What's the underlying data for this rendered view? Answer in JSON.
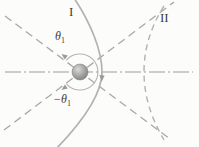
{
  "figure": {
    "labels": {
      "trajectory_i": "I",
      "trajectory_ii": "II",
      "angle_upper_base": "θ",
      "angle_upper_sub": "1",
      "angle_lower_base": "−θ",
      "angle_lower_sub": "1"
    },
    "colors": {
      "bg": "#fcfcfb",
      "asymptote": "#a8a8a8",
      "axis": "#9c9c9c",
      "curve": "#b2b2b2",
      "arc": "#b5b5b5",
      "arrow": "#9a9a9a",
      "label": "#3d3d3d",
      "sphere_light": "#d9d9d7",
      "sphere_mid": "#a6a6a4",
      "sphere_dark": "#7a7a78"
    }
  }
}
